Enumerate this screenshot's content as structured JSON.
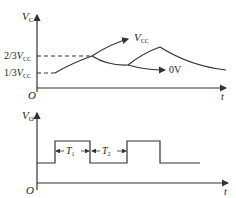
{
  "top_plot": {
    "y_axis_label": "V",
    "y_axis_sub": "C",
    "x_axis_label": "t",
    "origin_label": "O",
    "level_high": {
      "prefix": "2/3",
      "var": "V",
      "sub": "CC"
    },
    "level_low": {
      "prefix": "1/3",
      "var": "V",
      "sub": "CC"
    },
    "asymptote_up": {
      "var": "V",
      "sub": "CC"
    },
    "asymptote_down": "0V"
  },
  "bottom_plot": {
    "y_axis_label": "V",
    "y_axis_sub": "O",
    "x_axis_label": "t",
    "origin_label": "O",
    "t1": {
      "var": "T",
      "sub": "1"
    },
    "t2": {
      "var": "T",
      "sub": "2"
    }
  }
}
